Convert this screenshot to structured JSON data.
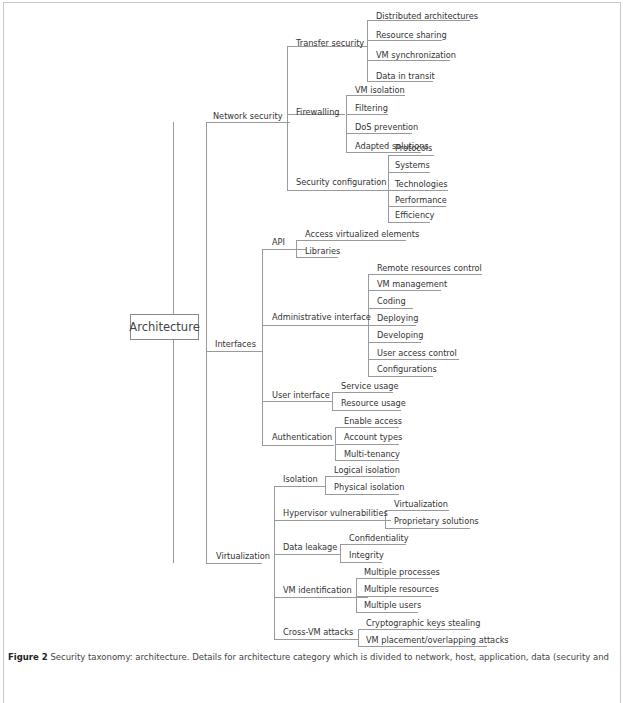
{
  "root": {
    "label": "Architecture",
    "x": 130,
    "y": 314,
    "w": 67,
    "h": 24
  },
  "nodes": [
    {
      "id": "network-security",
      "label": "Network security",
      "x": 213,
      "y": 111,
      "ux": 206,
      "uw": 84,
      "uy": 122
    },
    {
      "id": "transfer-security",
      "label": "Transfer security",
      "x": 296,
      "y": 38,
      "ux": 287,
      "uw": 80,
      "uy": 46
    },
    {
      "id": "distributed-architectures",
      "label": "Distributed architectures",
      "x": 376,
      "y": 11,
      "ux": 367,
      "uw": 103,
      "uy": 20
    },
    {
      "id": "resource-sharing",
      "label": "Resource sharing",
      "x": 376,
      "y": 30,
      "ux": 367,
      "uw": 75,
      "uy": 40
    },
    {
      "id": "vm-synchronization",
      "label": "VM synchronization",
      "x": 376,
      "y": 50,
      "ux": 367,
      "uw": 83,
      "uy": 60
    },
    {
      "id": "data-in-transit",
      "label": "Data in transit",
      "x": 376,
      "y": 71,
      "ux": 367,
      "uw": 66,
      "uy": 81
    },
    {
      "id": "firewalling",
      "label": "Firewalling",
      "x": 296,
      "y": 107,
      "ux": 287,
      "uw": 58,
      "uy": 114
    },
    {
      "id": "vm-isolation",
      "label": "VM isolation",
      "x": 355,
      "y": 85,
      "ux": 346,
      "uw": 59,
      "uy": 95
    },
    {
      "id": "filtering",
      "label": "Filtering",
      "x": 355,
      "y": 103,
      "ux": 346,
      "uw": 42,
      "uy": 114
    },
    {
      "id": "dos-prevention",
      "label": "DoS prevention",
      "x": 355,
      "y": 122,
      "ux": 346,
      "uw": 66,
      "uy": 133
    },
    {
      "id": "adapted-solutions",
      "label": "Adapted solutions",
      "x": 355,
      "y": 141,
      "ux": 346,
      "uw": 75,
      "uy": 152
    },
    {
      "id": "security-configuration",
      "label": "Security configuration",
      "x": 296,
      "y": 177,
      "ux": 287,
      "uw": 101,
      "uy": 190
    },
    {
      "id": "protocols",
      "label": "Protocols",
      "x": 395,
      "y": 143,
      "ux": 388,
      "uw": 46,
      "uy": 155
    },
    {
      "id": "systems",
      "label": "Systems",
      "x": 395,
      "y": 160,
      "ux": 388,
      "uw": 42,
      "uy": 172
    },
    {
      "id": "technologies",
      "label": "Technologies",
      "x": 395,
      "y": 179,
      "ux": 388,
      "uw": 60,
      "uy": 190
    },
    {
      "id": "performance",
      "label": "Performance",
      "x": 395,
      "y": 195,
      "ux": 388,
      "uw": 58,
      "uy": 206
    },
    {
      "id": "efficiency",
      "label": "Efficiency",
      "x": 395,
      "y": 210,
      "ux": 388,
      "uw": 42,
      "uy": 222
    },
    {
      "id": "interfaces",
      "label": "Interfaces",
      "x": 215,
      "y": 339,
      "ux": 206,
      "uw": 56,
      "uy": 351
    },
    {
      "id": "api",
      "label": "API",
      "x": 272,
      "y": 237,
      "ux": 262,
      "uw": 44,
      "uy": 249
    },
    {
      "id": "access-virtualized-elements",
      "label": "Access virtualized elements",
      "x": 305,
      "y": 229,
      "ux": 296,
      "uw": 110,
      "uy": 240
    },
    {
      "id": "libraries",
      "label": "Libraries",
      "x": 305,
      "y": 246,
      "ux": 296,
      "uw": 42,
      "uy": 257
    },
    {
      "id": "administrative-interface",
      "label": "Administrative interface",
      "x": 272,
      "y": 312,
      "ux": 262,
      "uw": 113,
      "uy": 325
    },
    {
      "id": "remote-resources-control",
      "label": "Remote resources control",
      "x": 377,
      "y": 263,
      "ux": 368,
      "uw": 114,
      "uy": 274
    },
    {
      "id": "vm-management",
      "label": "VM management",
      "x": 377,
      "y": 279,
      "ux": 368,
      "uw": 73,
      "uy": 290
    },
    {
      "id": "coding",
      "label": "Coding",
      "x": 377,
      "y": 296,
      "ux": 368,
      "uw": 45,
      "uy": 308
    },
    {
      "id": "deploying",
      "label": "Deploying",
      "x": 377,
      "y": 313,
      "ux": 368,
      "uw": 48,
      "uy": 325
    },
    {
      "id": "developing",
      "label": "Developing",
      "x": 377,
      "y": 330,
      "ux": 368,
      "uw": 53,
      "uy": 342
    },
    {
      "id": "user-access-control",
      "label": "User access control",
      "x": 377,
      "y": 348,
      "ux": 368,
      "uw": 91,
      "uy": 359
    },
    {
      "id": "configurations",
      "label": "Configurations",
      "x": 377,
      "y": 364,
      "ux": 368,
      "uw": 65,
      "uy": 376
    },
    {
      "id": "user-interface",
      "label": "User interface",
      "x": 272,
      "y": 390,
      "ux": 262,
      "uw": 70,
      "uy": 401
    },
    {
      "id": "service-usage",
      "label": "Service usage",
      "x": 341,
      "y": 381,
      "ux": 332,
      "uw": 61,
      "uy": 392
    },
    {
      "id": "resource-usage",
      "label": "Resource usage",
      "x": 341,
      "y": 398,
      "ux": 332,
      "uw": 69,
      "uy": 410
    },
    {
      "id": "authentication",
      "label": "Authentication",
      "x": 272,
      "y": 432,
      "ux": 262,
      "uw": 72,
      "uy": 445
    },
    {
      "id": "enable-access",
      "label": "Enable access",
      "x": 344,
      "y": 416,
      "ux": 335,
      "uw": 64,
      "uy": 427
    },
    {
      "id": "account-types",
      "label": "Account types",
      "x": 344,
      "y": 432,
      "ux": 335,
      "uw": 64,
      "uy": 444
    },
    {
      "id": "multi-tenancy",
      "label": "Multi-tenancy",
      "x": 344,
      "y": 449,
      "ux": 335,
      "uw": 64,
      "uy": 460
    },
    {
      "id": "virtualization",
      "label": "Virtualization",
      "x": 216,
      "y": 551,
      "ux": 206,
      "uw": 56,
      "uy": 563
    },
    {
      "id": "isolation",
      "label": "Isolation",
      "x": 283,
      "y": 474,
      "ux": 274,
      "uw": 52,
      "uy": 486
    },
    {
      "id": "logical-isolation",
      "label": "Logical isolation",
      "x": 334,
      "y": 465,
      "ux": 325,
      "uw": 71,
      "uy": 476
    },
    {
      "id": "physical-isolation",
      "label": "Physical isolation",
      "x": 334,
      "y": 482,
      "ux": 325,
      "uw": 74,
      "uy": 494
    },
    {
      "id": "hypervisor-vulnerabilities",
      "label": "Hypervisor vulnerabilities",
      "x": 283,
      "y": 508,
      "ux": 274,
      "uw": 117,
      "uy": 520
    },
    {
      "id": "virtualization-leaf",
      "label": "Virtualization",
      "x": 394,
      "y": 499,
      "ux": 385,
      "uw": 64,
      "uy": 510
    },
    {
      "id": "proprietary-solutions",
      "label": "Proprietary solutions",
      "x": 394,
      "y": 516,
      "ux": 385,
      "uw": 85,
      "uy": 528
    },
    {
      "id": "data-leakage",
      "label": "Data leakage",
      "x": 283,
      "y": 542,
      "ux": 274,
      "uw": 66,
      "uy": 554
    },
    {
      "id": "confidentiality",
      "label": "Confidentiality",
      "x": 349,
      "y": 533,
      "ux": 340,
      "uw": 66,
      "uy": 544
    },
    {
      "id": "integrity",
      "label": "Integrity",
      "x": 349,
      "y": 550,
      "ux": 340,
      "uw": 42,
      "uy": 562
    },
    {
      "id": "vm-identification",
      "label": "VM identification",
      "x": 283,
      "y": 585,
      "ux": 274,
      "uw": 94,
      "uy": 597
    },
    {
      "id": "multiple-processes",
      "label": "Multiple processes",
      "x": 364,
      "y": 567,
      "ux": 356,
      "uw": 76,
      "uy": 578
    },
    {
      "id": "multiple-resources",
      "label": "Multiple resources",
      "x": 364,
      "y": 584,
      "ux": 356,
      "uw": 76,
      "uy": 596
    },
    {
      "id": "multiple-users",
      "label": "Multiple users",
      "x": 364,
      "y": 600,
      "ux": 356,
      "uw": 62,
      "uy": 612
    },
    {
      "id": "cross-vm-attacks",
      "label": "Cross-VM attacks",
      "x": 283,
      "y": 627,
      "ux": 274,
      "uw": 84,
      "uy": 639
    },
    {
      "id": "cryptographic-keys-stealing",
      "label": "Cryptographic keys stealing",
      "x": 366,
      "y": 618,
      "ux": 358,
      "uw": 112,
      "uy": 629
    },
    {
      "id": "vm-placement",
      "label": "VM placement/overlapping attacks",
      "x": 366,
      "y": 635,
      "ux": 358,
      "uw": 129,
      "uy": 646
    }
  ],
  "verticals": [
    {
      "x": 173,
      "y1": 122,
      "y2": 563
    },
    {
      "x": 206,
      "y1": 122,
      "y2": 563
    },
    {
      "x": 287,
      "y1": 46,
      "y2": 190
    },
    {
      "x": 367,
      "y1": 20,
      "y2": 81
    },
    {
      "x": 346,
      "y1": 95,
      "y2": 152
    },
    {
      "x": 388,
      "y1": 155,
      "y2": 222
    },
    {
      "x": 262,
      "y1": 249,
      "y2": 445
    },
    {
      "x": 296,
      "y1": 240,
      "y2": 257
    },
    {
      "x": 368,
      "y1": 274,
      "y2": 376
    },
    {
      "x": 332,
      "y1": 392,
      "y2": 410
    },
    {
      "x": 335,
      "y1": 427,
      "y2": 460
    },
    {
      "x": 274,
      "y1": 486,
      "y2": 639
    },
    {
      "x": 325,
      "y1": 476,
      "y2": 494
    },
    {
      "x": 385,
      "y1": 510,
      "y2": 528
    },
    {
      "x": 340,
      "y1": 544,
      "y2": 562
    },
    {
      "x": 356,
      "y1": 578,
      "y2": 612
    },
    {
      "x": 358,
      "y1": 629,
      "y2": 646
    }
  ],
  "caption": {
    "prefix": "Figure 2",
    "text": "Security taxonomy: architecture. Details for architecture category which is divided to network, host, application, data (security and"
  }
}
